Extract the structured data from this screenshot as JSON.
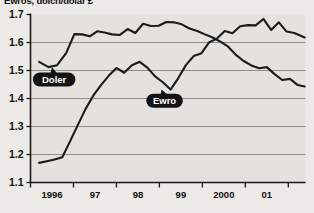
{
  "chart_data": {
    "type": "line",
    "title": "Ewros, dolcn/dolar £",
    "xlabel": "",
    "ylabel": "",
    "ylim": [
      1.1,
      1.7
    ],
    "xlim": [
      1995.5,
      2001.9
    ],
    "grid": true,
    "legend_position": "inline-callouts",
    "y_ticks": [
      "1.1",
      "1.2",
      "1.3",
      "1.4",
      "1.5",
      "1.6",
      "1.7"
    ],
    "y_tick_values": [
      1.1,
      1.2,
      1.3,
      1.4,
      1.5,
      1.6,
      1.7
    ],
    "x_ticks": [
      "1996",
      "97",
      "98",
      "99",
      "2000",
      "01"
    ],
    "x_tick_values": [
      1996,
      1997,
      1998,
      1999,
      2000,
      2001
    ],
    "annotations": [
      {
        "label": "Doler",
        "x": 1996.05,
        "y": 1.468,
        "points_to_x": 1996.0,
        "points_to_y": 1.512
      },
      {
        "label": "Ewro",
        "x": 1998.62,
        "y": 1.392,
        "points_to_x": 1998.55,
        "points_to_y": 1.432
      }
    ],
    "series": [
      {
        "name": "Doler",
        "color": "#1b1b1b",
        "x": [
          1995.7,
          1995.92,
          1996.12,
          1996.33,
          1996.52,
          1996.7,
          1996.88,
          1997.05,
          1997.22,
          1997.4,
          1997.58,
          1997.76,
          1997.94,
          1998.12,
          1998.3,
          1998.48,
          1998.66,
          1998.84,
          1999.02,
          1999.2,
          1999.38,
          1999.56,
          1999.74,
          1999.92,
          2000.1,
          2000.28,
          2000.46,
          2000.64,
          2000.82,
          2001.0,
          2001.18,
          2001.36,
          2001.54,
          2001.72,
          2001.88
        ],
        "values": [
          1.531,
          1.512,
          1.519,
          1.562,
          1.63,
          1.629,
          1.622,
          1.64,
          1.636,
          1.629,
          1.627,
          1.648,
          1.634,
          1.667,
          1.659,
          1.66,
          1.673,
          1.672,
          1.665,
          1.65,
          1.641,
          1.629,
          1.618,
          1.603,
          1.585,
          1.556,
          1.534,
          1.518,
          1.508,
          1.512,
          1.487,
          1.466,
          1.47,
          1.448,
          1.443
        ]
      },
      {
        "name": "Ewro",
        "color": "#1b1b1b",
        "x": [
          1995.7,
          1995.88,
          1996.06,
          1996.24,
          1996.42,
          1996.6,
          1996.78,
          1996.96,
          1997.14,
          1997.32,
          1997.5,
          1997.68,
          1997.86,
          1998.04,
          1998.22,
          1998.4,
          1998.58,
          1998.76,
          1998.94,
          1999.12,
          1999.3,
          1999.48,
          1999.66,
          1999.84,
          2000.02,
          2000.2,
          2000.38,
          2000.56,
          2000.74,
          2000.92,
          2001.1,
          2001.28,
          2001.46,
          2001.64,
          2001.88
        ],
        "values": [
          1.17,
          1.176,
          1.182,
          1.19,
          1.247,
          1.305,
          1.362,
          1.41,
          1.448,
          1.481,
          1.509,
          1.492,
          1.519,
          1.531,
          1.51,
          1.479,
          1.458,
          1.432,
          1.473,
          1.52,
          1.552,
          1.562,
          1.601,
          1.614,
          1.641,
          1.633,
          1.658,
          1.662,
          1.661,
          1.684,
          1.645,
          1.672,
          1.639,
          1.634,
          1.618
        ]
      }
    ]
  }
}
